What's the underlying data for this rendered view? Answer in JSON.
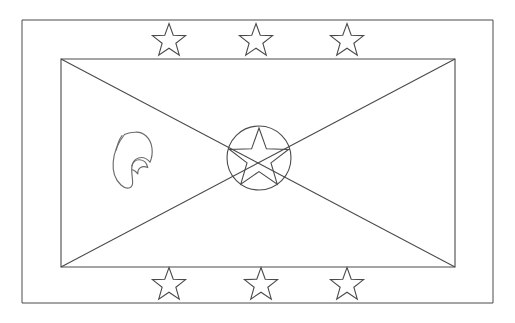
{
  "page": {
    "title": "Flag of Grenada Coloring Page",
    "style": "black and white line art / coloring page",
    "background_color": "#ffffff",
    "line_color": "#4a4a4a",
    "emblem_line_color": "#6b6b6b",
    "canvas": {
      "width": 515,
      "height": 323
    }
  },
  "artwork": {
    "outer_border": {
      "name": "page-frame",
      "x": 22,
      "y": 20,
      "width": 471,
      "height": 283,
      "label": "Outer page border"
    },
    "flag_rectangle": {
      "name": "flag-field",
      "x": 61,
      "y": 59,
      "width": 394,
      "height": 208,
      "label": "Flag field rectangle"
    },
    "diagonals": {
      "label": "Saltire diagonals from flag corners",
      "count": 4,
      "converge_at": {
        "x": 258,
        "y": 163
      },
      "lines": [
        {
          "name": "diagonal-top-left",
          "x1": 61,
          "y1": 59,
          "x2": 258,
          "y2": 163
        },
        {
          "name": "diagonal-top-right",
          "x1": 455,
          "y1": 59,
          "x2": 258,
          "y2": 163
        },
        {
          "name": "diagonal-bottom-left",
          "x1": 61,
          "y1": 267,
          "x2": 258,
          "y2": 163
        },
        {
          "name": "diagonal-bottom-right",
          "x1": 455,
          "y1": 267,
          "x2": 258,
          "y2": 163
        }
      ]
    },
    "center_disc": {
      "name": "center-circle",
      "cx": 259,
      "cy": 158,
      "r": 32,
      "label": "Central red disc outline"
    },
    "center_star": {
      "name": "center-star",
      "cx": 259,
      "cy": 159,
      "outer_radius": 31,
      "inner_radius": 12.6,
      "points": 5,
      "rotation_deg": -90,
      "label": "Central five-pointed star"
    },
    "border_stars": {
      "label": "Six yellow border stars (three top, three bottom)",
      "count": 6,
      "outer_radius": 17.5,
      "inner_radius": 7.2,
      "points": 5,
      "items": [
        {
          "name": "star-top-left",
          "cx": 169,
          "cy": 41,
          "position": "top"
        },
        {
          "name": "star-top-center",
          "cx": 256,
          "cy": 41,
          "position": "top"
        },
        {
          "name": "star-top-right",
          "cx": 347,
          "cy": 41,
          "position": "top"
        },
        {
          "name": "star-bottom-left",
          "cx": 169,
          "cy": 285,
          "position": "bottom"
        },
        {
          "name": "star-bottom-center",
          "cx": 261,
          "cy": 285,
          "position": "bottom"
        },
        {
          "name": "star-bottom-right",
          "cx": 347,
          "cy": 285,
          "position": "bottom"
        }
      ]
    },
    "nutmeg_emblem": {
      "name": "nutmeg-emblem",
      "label": "Nutmeg pod emblem on hoist side",
      "x": 112,
      "y": 132,
      "width": 42,
      "height": 57,
      "outline_path": "M 124.5 134.5 C 118.5 142 114.0 152.5 113.2 162.0 C 112.4 171.8 115.5 180.0 121.0 185.0 C 124.0 187.8 127.5 188.8 130.2 187.5 C 132.0 186.6 132.8 184.6 132.6 181.4 C 132.4 177.4 131.4 172.0 131.8 167.5 C 132.2 162.6 134.6 159.2 138.4 158.0 C 142.6 156.7 147.0 158.6 150.0 162.2 C 151.8 158.0 152.6 153.2 152.0 148.2 C 150.8 138.2 143.8 131.6 135.2 132.2 C 131.2 132.5 127.6 133.0 124.5 134.5 Z",
      "inner_path": "M 131.8 166.0 C 133.0 162.0 136.0 159.6 139.6 159.8 C 143.6 160.0 146.8 163.0 147.8 167.6 C 145.2 166.4 142.6 166.2 140.6 167.4 C 138.6 168.6 137.6 171.0 137.8 174.0 C 136.0 171.6 134.0 170.0 132.4 169.8",
      "detail_path": "M 122.0 135.5 C 119.0 139.8 117.2 145.0 116.4 150.0"
    }
  }
}
